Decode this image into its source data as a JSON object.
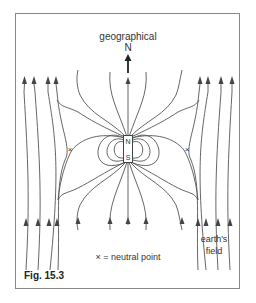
{
  "figure": {
    "caption": "Fig. 15.3",
    "top_label": "geographical",
    "north_label": "N",
    "magnet": {
      "north_pole": "N",
      "south_pole": "S"
    },
    "neutral_marker": "×",
    "legend": "× = neutral point",
    "field_label_line1": "earth's",
    "field_label_line2": "field",
    "colors": {
      "line": "#555555",
      "frame": "#888888",
      "text": "#333333",
      "background": "#ffffff"
    }
  }
}
